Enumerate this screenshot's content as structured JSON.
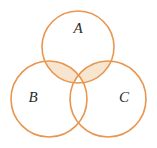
{
  "figure": {
    "name": "three-set-venn-diagram",
    "width": 157,
    "height": 148,
    "background_color": "#ffffff"
  },
  "style": {
    "stroke_color": "#e8964e",
    "stroke_width": 1.6,
    "shade_fill_color": "#f7e5cf",
    "label_color": "#2b2b2b",
    "circle_fill": "none"
  },
  "sets": [
    {
      "id": "A",
      "label": "A",
      "label_x": 78,
      "label_y": 30,
      "cx": 78,
      "cy": 47,
      "r": 36
    },
    {
      "id": "B",
      "label": "B",
      "label_x": 33,
      "label_y": 99,
      "cx": 49,
      "cy": 99,
      "r": 38
    },
    {
      "id": "C",
      "label": "C",
      "label_x": 124,
      "label_y": 99,
      "cx": 108,
      "cy": 99,
      "r": 38
    }
  ],
  "shaded_regions": [
    {
      "id": "A-and-B-only",
      "sets": [
        "A",
        "B"
      ],
      "excludes": [
        "C"
      ],
      "shaded": true
    },
    {
      "id": "A-and-C-only",
      "sets": [
        "A",
        "C"
      ],
      "excludes": [
        "B"
      ],
      "shaded": true
    },
    {
      "id": "B-and-C-only",
      "sets": [
        "B",
        "C"
      ],
      "excludes": [
        "A"
      ],
      "shaded": false
    },
    {
      "id": "A-and-B-and-C",
      "sets": [
        "A",
        "B",
        "C"
      ],
      "excludes": [],
      "shaded": false
    }
  ]
}
